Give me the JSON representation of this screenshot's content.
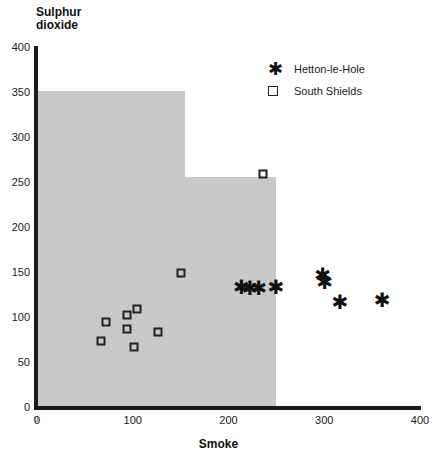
{
  "chart_data": {
    "type": "scatter",
    "title": "",
    "xlabel": "Smoke",
    "ylabel": "Sulphur dioxide",
    "xlim": [
      0,
      400
    ],
    "ylim": [
      0,
      400
    ],
    "xticks": [
      0,
      100,
      200,
      300,
      400
    ],
    "yticks": [
      0,
      50,
      100,
      150,
      200,
      250,
      300,
      350,
      400
    ],
    "grid": false,
    "legend_position": "top-right",
    "series": [
      {
        "name": "Hetton-le-Hole",
        "marker": "asterisk",
        "color": "#111111",
        "points": [
          {
            "x": 213,
            "y": 135
          },
          {
            "x": 222,
            "y": 133
          },
          {
            "x": 231,
            "y": 133
          },
          {
            "x": 249,
            "y": 135
          },
          {
            "x": 298,
            "y": 148
          },
          {
            "x": 300,
            "y": 140
          },
          {
            "x": 316,
            "y": 118
          },
          {
            "x": 360,
            "y": 120
          }
        ]
      },
      {
        "name": "South Shields",
        "marker": "open-square",
        "color": "#222222",
        "points": [
          {
            "x": 72,
            "y": 96
          },
          {
            "x": 67,
            "y": 75
          },
          {
            "x": 94,
            "y": 103
          },
          {
            "x": 94,
            "y": 88
          },
          {
            "x": 104,
            "y": 110
          },
          {
            "x": 101,
            "y": 68
          },
          {
            "x": 126,
            "y": 85
          },
          {
            "x": 150,
            "y": 150
          },
          {
            "x": 236,
            "y": 260
          }
        ]
      }
    ],
    "shaded_region": {
      "fill": "#c9c9c9",
      "description": "stepped shaded envelope",
      "steps": [
        {
          "x_start": 0,
          "x_end": 155,
          "y_top": 352
        },
        {
          "x_start": 0,
          "x_end": 250,
          "y_top": 257
        }
      ]
    }
  },
  "axis": {
    "y_title_line1": "Sulphur",
    "y_title_line2": "dioxide",
    "x_title": "Smoke",
    "y_tick_labels": [
      "400",
      "350",
      "300",
      "250",
      "200",
      "150",
      "100",
      "50",
      "0"
    ],
    "x_tick_labels": [
      "0",
      "100",
      "200",
      "300",
      "400"
    ],
    "x_origin_label": "0"
  },
  "legend": {
    "items": [
      {
        "label": "Hetton-le-Hole",
        "glyph": "asterisk-marker"
      },
      {
        "label": "South Shields",
        "glyph": "open-square-marker"
      }
    ]
  }
}
